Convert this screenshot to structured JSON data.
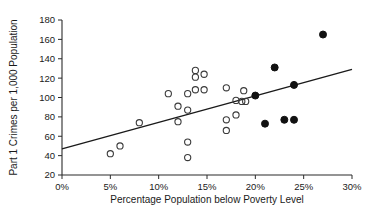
{
  "chart_data": {
    "type": "scatter",
    "title": "",
    "xlabel": "Percentage Population below Poverty Level",
    "ylabel": "Part 1 Crimes per 1,000 Population",
    "xlim": [
      0,
      30
    ],
    "ylim": [
      20,
      180
    ],
    "grid": false,
    "legend_position": "none",
    "xtick_labels": [
      "0%",
      "5%",
      "10%",
      "15%",
      "20%",
      "25%",
      "30%"
    ],
    "xtick_values": [
      0,
      5,
      10,
      15,
      20,
      25,
      30
    ],
    "ytick_labels": [
      "20",
      "40",
      "60",
      "80",
      "100",
      "120",
      "140",
      "160",
      "180"
    ],
    "ytick_values": [
      20,
      40,
      60,
      80,
      100,
      120,
      140,
      160,
      180
    ],
    "series": [
      {
        "name": "open-circles",
        "marker": "open-circle",
        "color": "#3a3a3a",
        "points": [
          {
            "x": 5.0,
            "y": 42
          },
          {
            "x": 6.0,
            "y": 50
          },
          {
            "x": 8.0,
            "y": 74
          },
          {
            "x": 11.0,
            "y": 104
          },
          {
            "x": 12.0,
            "y": 91
          },
          {
            "x": 12.0,
            "y": 75
          },
          {
            "x": 13.0,
            "y": 104
          },
          {
            "x": 13.0,
            "y": 87
          },
          {
            "x": 13.0,
            "y": 54
          },
          {
            "x": 13.0,
            "y": 38
          },
          {
            "x": 13.8,
            "y": 128
          },
          {
            "x": 13.8,
            "y": 121
          },
          {
            "x": 13.8,
            "y": 108
          },
          {
            "x": 14.7,
            "y": 124
          },
          {
            "x": 14.7,
            "y": 108
          },
          {
            "x": 17.0,
            "y": 110
          },
          {
            "x": 17.0,
            "y": 77
          },
          {
            "x": 17.0,
            "y": 66
          },
          {
            "x": 18.0,
            "y": 97
          },
          {
            "x": 18.0,
            "y": 82
          },
          {
            "x": 18.6,
            "y": 96
          },
          {
            "x": 18.8,
            "y": 107
          },
          {
            "x": 19.0,
            "y": 96
          }
        ]
      },
      {
        "name": "filled-circles",
        "marker": "filled-circle",
        "color": "#111111",
        "points": [
          {
            "x": 20.0,
            "y": 102
          },
          {
            "x": 21.0,
            "y": 73
          },
          {
            "x": 22.0,
            "y": 131
          },
          {
            "x": 23.0,
            "y": 77
          },
          {
            "x": 24.0,
            "y": 113
          },
          {
            "x": 24.0,
            "y": 77
          },
          {
            "x": 27.0,
            "y": 165
          }
        ]
      }
    ],
    "trend_line": {
      "name": "regression-line",
      "x_start": 0,
      "y_start": 47,
      "x_end": 30,
      "y_end": 129
    }
  }
}
